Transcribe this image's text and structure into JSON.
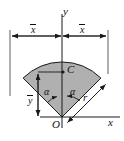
{
  "figure": {
    "background_color": "#ffffff",
    "sector_fill": "#b0b0b0",
    "line_color": "#1a1a1a",
    "labels": {
      "axis_y": "y",
      "axis_x": "x",
      "origin": "O",
      "centroid": "C",
      "radius": "r",
      "x_bar_left": "x",
      "x_bar_right": "x",
      "y_bar": "y",
      "angle_left": "α",
      "angle_right": "α"
    },
    "geometry": {
      "apex_x": 62,
      "apex_y": 117,
      "radius_px": 55,
      "half_angle_deg": 45,
      "sector_start_deg": 45,
      "sector_end_deg": 135,
      "centroid_x": 62,
      "centroid_y": 72,
      "dimension_line_y": 36,
      "dim_left_x": 10,
      "dim_right_x": 108,
      "ybar_line_x": 38
    }
  }
}
